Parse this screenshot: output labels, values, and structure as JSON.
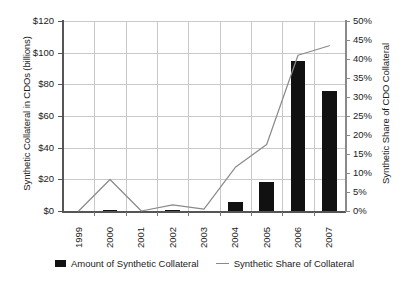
{
  "chart_data": {
    "type": "bar",
    "title": "",
    "subtitle": "",
    "xlabel": "",
    "categories": [
      "1999",
      "2000",
      "2001",
      "2002",
      "2003",
      "2004",
      "2005",
      "2006",
      "2007"
    ],
    "grid": true,
    "legend_position": "bottom",
    "axes": {
      "left": {
        "label": "Synthetic Collateral in CDOs (billions)",
        "ticks": [
          "$0",
          "$20",
          "$40",
          "$60",
          "$80",
          "$100",
          "$120"
        ],
        "values": [
          0,
          20,
          40,
          60,
          80,
          100,
          120
        ],
        "min": 0,
        "max": 120
      },
      "right": {
        "label": "Synthetic Share of CDO Collateral",
        "ticks": [
          "0%",
          "5%",
          "10%",
          "15%",
          "20%",
          "25%",
          "30%",
          "35%",
          "40%",
          "45%",
          "50%"
        ],
        "values": [
          0,
          5,
          10,
          15,
          20,
          25,
          30,
          35,
          40,
          45,
          50
        ],
        "min": 0,
        "max": 50
      }
    },
    "series": [
      {
        "name": "Amount of Synthetic Collateral",
        "type": "bar",
        "axis": "left",
        "color": "#111111",
        "values": [
          0,
          0.8,
          0,
          0.4,
          0,
          5.5,
          18.5,
          95,
          76
        ]
      },
      {
        "name": "Synthetic Share of Collateral",
        "type": "line",
        "axis": "right",
        "color": "#8a8a8a",
        "values": [
          0,
          8.3,
          0,
          1.6,
          0.5,
          11.5,
          17.5,
          41,
          43.5
        ]
      }
    ]
  },
  "legend": {
    "items": [
      {
        "label": "Amount of Synthetic Collateral",
        "marker": "bar-swatch"
      },
      {
        "label": "Synthetic Share of Collateral",
        "marker": "line-swatch"
      }
    ]
  },
  "colors": {
    "bar": "#111111",
    "line": "#8a8a8a",
    "grid": "#c9c9c9",
    "axis": "#555555",
    "text": "#1a1a1a",
    "background": "#ffffff"
  }
}
